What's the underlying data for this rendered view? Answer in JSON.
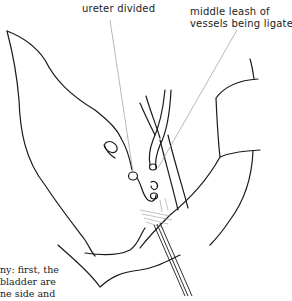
{
  "labels": {
    "ureter": "ureter divided",
    "leash_line1": "middle leash of",
    "leash_line2": "vessels being ligated"
  },
  "body_text": {
    "line1": "ny: first, the",
    "line2": " bladder are",
    "line3": "ne side and"
  },
  "colors": {
    "stroke": "#1a1a1a",
    "leader": "#888888",
    "background": "#ffffff"
  }
}
